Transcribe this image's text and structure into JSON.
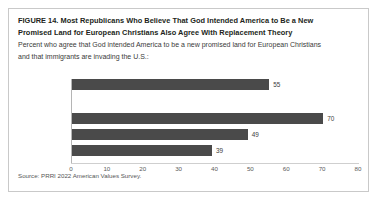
{
  "figure": {
    "title_lines": [
      "FIGURE 14.  Most Republicans Who Believe That God Intended America to Be a New",
      "Promised Land for European Christians Also Agree With Replacement Theory"
    ],
    "subtitle_lines": [
      "Percent who agree that God intended America to be a new promised land for European Christians",
      "and that immigrants are invading the U.S.:"
    ],
    "source": "Source: PRRI 2022 American Values Survey.",
    "colors": {
      "bar": "#4a4a4a",
      "frame": "#c9c9c9",
      "axis": "#b5b5b5",
      "text": "#231f20",
      "background": "#ffffff"
    }
  },
  "chart_data": {
    "type": "bar",
    "orientation": "horizontal",
    "title": "FIGURE 14.  Most Republicans Who Believe That God Intended America to Be a New Promised Land for European Christians Also Agree With Replacement Theory",
    "subtitle": "Percent who agree that God intended America to be a new promised land for European Christians and that immigrants are invading the U.S.:",
    "categories": [
      "All Americans",
      "Republican",
      "Independent",
      "Democrat"
    ],
    "values": [
      55,
      70,
      49,
      39
    ],
    "value_labels": [
      "55",
      "70",
      "49",
      "39"
    ],
    "xlabel": "",
    "ylabel": "",
    "xlim": [
      0,
      80
    ],
    "xticks": [
      0,
      10,
      20,
      30,
      40,
      50,
      60,
      70,
      80
    ],
    "xtick_labels": [
      "0",
      "10",
      "20",
      "30",
      "40",
      "50",
      "60",
      "70",
      "80"
    ],
    "grid": false,
    "legend": false,
    "group_gap_after_index": 0,
    "source": "Source: PRRI 2022 American Values Survey."
  }
}
